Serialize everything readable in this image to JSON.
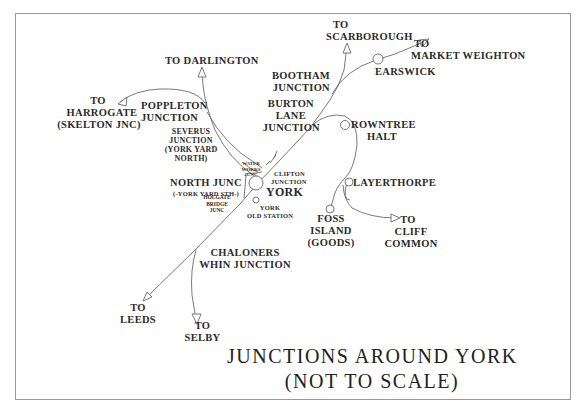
{
  "title": {
    "line1": "JUNCTIONS AROUND YORK",
    "line2": "(NOT TO SCALE)"
  },
  "destinations": {
    "darlington": "TO DARLINGTON",
    "scarborough_to": "TO",
    "scarborough": "SCARBOROUGH",
    "market_weighton_to": "TO",
    "market_weighton": "MARKET WEIGHTON",
    "harrogate_to": "TO",
    "harrogate": "HARROGATE",
    "harrogate_sub": "(SKELTON JNC)",
    "leeds_to": "TO",
    "leeds": "LEEDS",
    "selby_to": "TO",
    "selby": "SELBY",
    "cliff_common_to": "TO",
    "cliff_common_1": "CLIFF",
    "cliff_common_2": "COMMON"
  },
  "junctions": {
    "bootham_1": "BOOTHAM",
    "bootham_2": "JUNCTION",
    "burton_lane_1": "BURTON",
    "burton_lane_2": "LANE",
    "burton_lane_3": "JUNCTION",
    "poppleton_1": "POPPLETON",
    "poppleton_2": "JUNCTION",
    "severus_1": "SEVERUS",
    "severus_2": "JUNCTION",
    "severus_3": "(YORK YARD",
    "severus_4": "NORTH)",
    "waterworks_1": "WATER",
    "waterworks_2": "WORKS",
    "waterworks_3": "JUNC",
    "clifton_1": "CLIFTON",
    "clifton_2": "JUNCTION",
    "north_junc_1": "NORTH JUNC",
    "north_junc_2": "(-YORK YARD STH-)",
    "holgate_1": "HOLGATE",
    "holgate_2": "BRIDGE",
    "holgate_3": "JUNC",
    "chaloners_1": "CHALONERS",
    "chaloners_2": "WHIN JUNCTION"
  },
  "stations": {
    "york": "YORK",
    "york_old_1": "YORK",
    "york_old_2": "OLD STATION",
    "earswick": "EARSWICK",
    "rowntree_1": "ROWNTREE",
    "rowntree_2": "HALT",
    "layerthorpe": "LAYERTHORPE",
    "foss_1": "FOSS",
    "foss_2": "ISLAND",
    "foss_3": "(GOODS)"
  },
  "colors": {
    "line": "#6a6a6a",
    "text": "#2b2b2b",
    "frame": "#9a9a9a",
    "background": "#ffffff"
  }
}
